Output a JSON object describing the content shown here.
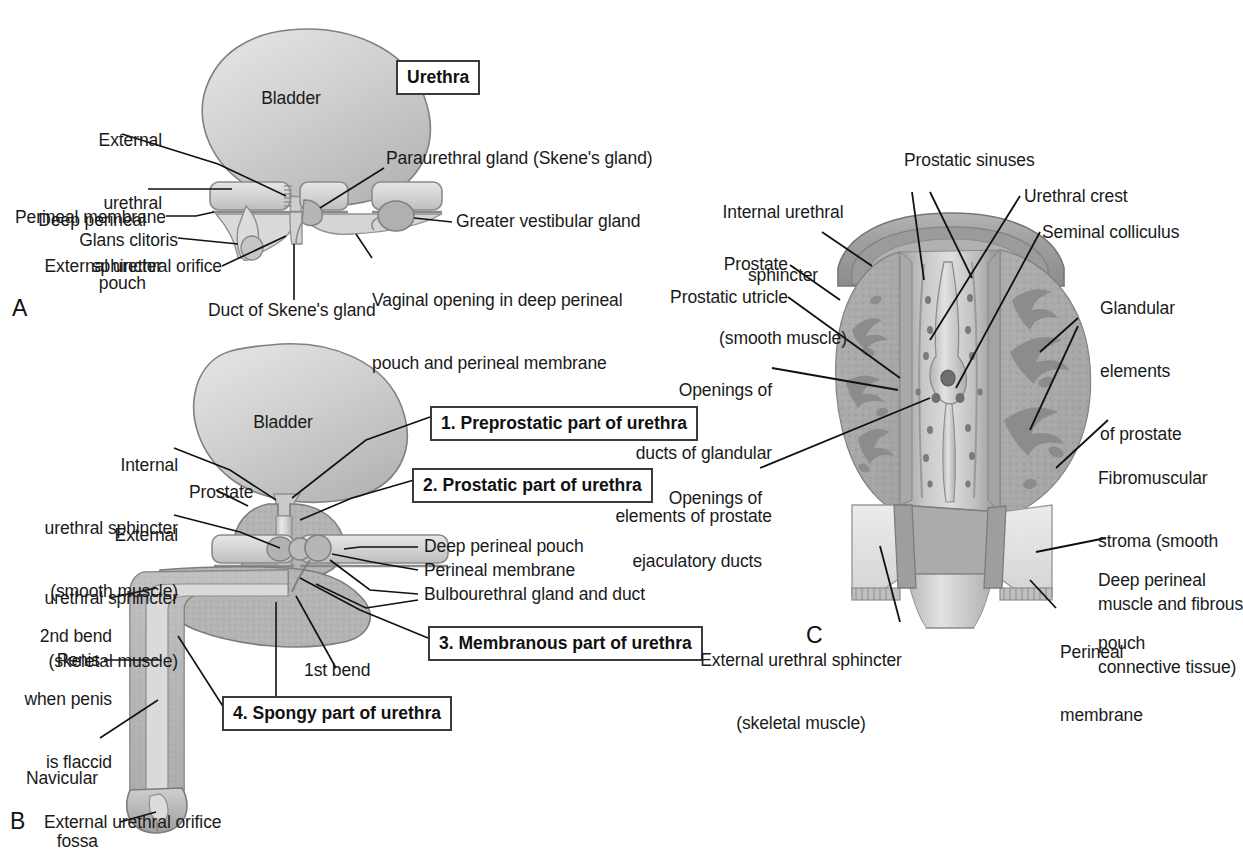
{
  "figure": {
    "background": "#ffffff",
    "ink": "#1a1a1a",
    "leader_color": "#111111",
    "tissue_light": "#d8d8d8",
    "tissue_mid": "#bfbfbf",
    "tissue_dark": "#9a9a9a",
    "tissue_deep": "#8a8a8a",
    "outline": "#6e6e6e"
  },
  "panels": [
    {
      "id": "A",
      "letter": "A",
      "caption": "Female urethra in sagittal/coronal schematic"
    },
    {
      "id": "B",
      "letter": "B",
      "caption": "Male urethra with four named parts"
    },
    {
      "id": "C",
      "letter": "C",
      "caption": "Prostatic urethra interior"
    }
  ],
  "panel_a": {
    "organ_label": "Bladder",
    "boxed": [
      {
        "id": "urethra",
        "text": "Urethra"
      }
    ],
    "labels": [
      {
        "id": "external-urethral-sphincter",
        "lines": [
          "External",
          "urethral",
          "sphincter"
        ]
      },
      {
        "id": "deep-perineal-pouch",
        "lines": [
          "Deep perineal",
          "pouch"
        ]
      },
      {
        "id": "perineal-membrane",
        "lines": [
          "Perineal membrane"
        ]
      },
      {
        "id": "glans-clitoris",
        "lines": [
          "Glans clitoris"
        ]
      },
      {
        "id": "external-urethral-orifice",
        "lines": [
          "External urethral orifice"
        ]
      },
      {
        "id": "duct-of-skenes-gland",
        "lines": [
          "Duct of Skene's gland"
        ]
      },
      {
        "id": "paraurethral-gland",
        "lines": [
          "Paraurethral gland (Skene's gland)"
        ]
      },
      {
        "id": "greater-vestibular-gland",
        "lines": [
          "Greater vestibular gland"
        ]
      },
      {
        "id": "vaginal-opening",
        "lines": [
          "Vaginal opening in deep perineal",
          "pouch and perineal membrane"
        ]
      }
    ]
  },
  "panel_b": {
    "organ_label": "Bladder",
    "boxed": [
      {
        "id": "part-1",
        "text": "1. Preprostatic part of urethra"
      },
      {
        "id": "part-2",
        "text": "2. Prostatic part of urethra"
      },
      {
        "id": "part-3",
        "text": "3. Membranous part of urethra"
      },
      {
        "id": "part-4",
        "text": "4. Spongy part of urethra"
      }
    ],
    "labels": [
      {
        "id": "internal-urethral-sphincter",
        "lines": [
          "Internal",
          "urethral sphincter",
          "(smooth muscle)"
        ]
      },
      {
        "id": "external-urethral-sphincter",
        "lines": [
          "External",
          "urethral sphincter",
          "(skeletal muscle)"
        ]
      },
      {
        "id": "prostate",
        "lines": [
          "Prostate"
        ]
      },
      {
        "id": "second-bend",
        "lines": [
          "2nd bend",
          "when penis",
          "is flaccid"
        ]
      },
      {
        "id": "penis",
        "lines": [
          "Penis"
        ]
      },
      {
        "id": "navicular-fossa",
        "lines": [
          "Navicular",
          "fossa"
        ]
      },
      {
        "id": "external-urethral-orifice",
        "lines": [
          "External urethral orifice"
        ]
      },
      {
        "id": "deep-perineal-pouch",
        "lines": [
          "Deep perineal pouch"
        ]
      },
      {
        "id": "perineal-membrane",
        "lines": [
          "Perineal membrane"
        ]
      },
      {
        "id": "bulbourethral-gland",
        "lines": [
          "Bulbourethral gland and duct"
        ]
      },
      {
        "id": "first-bend",
        "lines": [
          "1st bend"
        ]
      }
    ]
  },
  "panel_c": {
    "labels": [
      {
        "id": "internal-urethral-sphincter",
        "lines": [
          "Internal urethral",
          "sphincter",
          "(smooth muscle)"
        ]
      },
      {
        "id": "prostate",
        "lines": [
          "Prostate"
        ]
      },
      {
        "id": "prostatic-utricle",
        "lines": [
          "Prostatic utricle"
        ]
      },
      {
        "id": "openings-of-ducts",
        "lines": [
          "Openings of",
          "ducts of glandular",
          "elements of prostate"
        ]
      },
      {
        "id": "openings-of-ejaculatory-ducts",
        "lines": [
          "Openings of",
          "ejaculatory ducts"
        ]
      },
      {
        "id": "external-urethral-sphincter",
        "lines": [
          "External urethral sphincter",
          "(skeletal muscle)"
        ]
      },
      {
        "id": "prostatic-sinuses",
        "lines": [
          "Prostatic sinuses"
        ]
      },
      {
        "id": "urethral-crest",
        "lines": [
          "Urethral crest"
        ]
      },
      {
        "id": "seminal-colliculus",
        "lines": [
          "Seminal colliculus"
        ]
      },
      {
        "id": "glandular-elements",
        "lines": [
          "Glandular",
          "elements",
          "of prostate"
        ]
      },
      {
        "id": "fibromuscular-stroma",
        "lines": [
          "Fibromuscular",
          "stroma (smooth",
          "muscle and fibrous",
          "connective tissue)"
        ]
      },
      {
        "id": "deep-perineal-pouch",
        "lines": [
          "Deep perineal",
          "pouch"
        ]
      },
      {
        "id": "perineal-membrane",
        "lines": [
          "Perineal",
          "membrane"
        ]
      }
    ]
  }
}
